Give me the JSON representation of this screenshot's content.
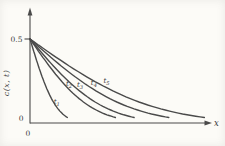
{
  "figure": {
    "background": "#fcfbf7",
    "line_color": "#4a4a4a",
    "text_color": "#3a3a3a"
  },
  "chart_data": {
    "type": "line",
    "title": "",
    "xlabel": "x",
    "ylabel": "c(x, t)",
    "grid": false,
    "legend": "inline-curve-labels",
    "x_axis": {
      "origin_label": "0",
      "arrow": true
    },
    "y_axis": {
      "origin_label": "0",
      "tick_labels": [
        "0.5"
      ],
      "tick_values": [
        0.5
      ],
      "max_value": 0.5,
      "arrow": true
    },
    "surface_concentration": 0.5,
    "model": "erfc_decay",
    "decay_arg": 1.3,
    "series": [
      {
        "name": "t1",
        "label_base": "t",
        "label_sub": "1",
        "reach_frac": 0.21,
        "label_frac": 0.77,
        "points": [
          [
            0,
            0.5
          ],
          [
            0.04,
            0.36
          ],
          [
            0.08,
            0.24
          ],
          [
            0.12,
            0.15
          ],
          [
            0.16,
            0.08
          ],
          [
            0.21,
            0.03
          ]
        ]
      },
      {
        "name": "t2",
        "label_base": "t",
        "label_sub": "2",
        "reach_frac": 0.48,
        "label_frac": 0.48,
        "points": [
          [
            0,
            0.5
          ],
          [
            0.1,
            0.35
          ],
          [
            0.19,
            0.22
          ],
          [
            0.29,
            0.13
          ],
          [
            0.38,
            0.06
          ],
          [
            0.48,
            0.03
          ]
        ]
      },
      {
        "name": "t3",
        "label_base": "t",
        "label_sub": "3",
        "reach_frac": 0.585,
        "label_frac": 0.5,
        "points": [
          [
            0,
            0.5
          ],
          [
            0.12,
            0.35
          ],
          [
            0.23,
            0.22
          ],
          [
            0.35,
            0.13
          ],
          [
            0.47,
            0.06
          ],
          [
            0.585,
            0.03
          ]
        ]
      },
      {
        "name": "t4",
        "label_base": "t",
        "label_sub": "4",
        "reach_frac": 0.78,
        "label_frac": 0.475,
        "points": [
          [
            0,
            0.5
          ],
          [
            0.16,
            0.35
          ],
          [
            0.31,
            0.22
          ],
          [
            0.47,
            0.13
          ],
          [
            0.62,
            0.06
          ],
          [
            0.78,
            0.03
          ]
        ]
      },
      {
        "name": "t5",
        "label_base": "t",
        "label_sub": "5",
        "reach_frac": 0.98,
        "label_frac": 0.45,
        "points": [
          [
            0,
            0.5
          ],
          [
            0.2,
            0.35
          ],
          [
            0.39,
            0.22
          ],
          [
            0.59,
            0.13
          ],
          [
            0.78,
            0.06
          ],
          [
            0.98,
            0.03
          ]
        ]
      }
    ]
  }
}
